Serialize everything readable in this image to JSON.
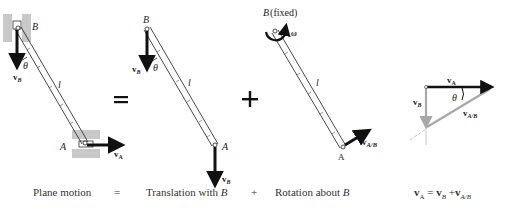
{
  "diagram": {
    "panels": [
      {
        "id": "plane-motion",
        "caption": "Plane motion",
        "labels": {
          "top": "B",
          "bottom": "A",
          "length": "l",
          "angle": "θ",
          "vel_top": "v",
          "vel_top_sub": "B",
          "vel_bottom": "v",
          "vel_bottom_sub": "A"
        }
      },
      {
        "id": "translation",
        "caption": "Translation with B",
        "labels": {
          "top": "B",
          "bottom": "A",
          "length": "l",
          "angle": "θ",
          "vel_top": "v",
          "vel_top_sub": "B",
          "vel_bottom": "v",
          "vel_bottom_sub": "B"
        }
      },
      {
        "id": "rotation",
        "caption": "Rotation about B",
        "labels": {
          "top": "B (fixed)",
          "bottom": "A",
          "length": "l",
          "omega": "ω",
          "vel_bottom": "v",
          "vel_bottom_sub": "A/B"
        }
      },
      {
        "id": "vector-triangle",
        "caption": "v_A = v_B + v_A/B",
        "labels": {
          "va": "v",
          "va_sub": "A",
          "vb": "v",
          "vb_sub": "B",
          "vab": "v",
          "vab_sub": "A/B",
          "angle": "θ"
        }
      }
    ],
    "operators": {
      "equals": "=",
      "plus": "+"
    },
    "captions": {
      "plane": "Plane motion",
      "eq": "=",
      "translation": "Translation with",
      "translation_var": "B",
      "plus": "+",
      "rotation": "Rotation about",
      "rotation_var": "B",
      "equation_lhs": "v",
      "equation_lhs_sub": "A",
      "equation_eq": "=",
      "equation_r1": "v",
      "equation_r1_sub": "B",
      "equation_plus": "+",
      "equation_r2": "v",
      "equation_r2_sub": "A/B"
    },
    "colors": {
      "ink": "#111111",
      "guide": "#b8b8b8",
      "gray_vector": "#a8a8a8",
      "hatch": "#c8c8c8"
    }
  }
}
